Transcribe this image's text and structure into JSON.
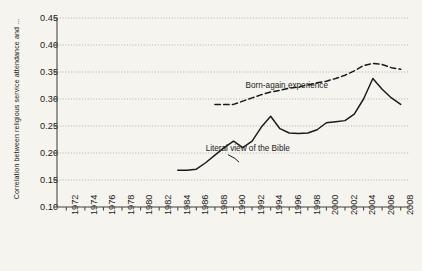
{
  "chart_data": {
    "type": "line",
    "title": "",
    "subtitle": "",
    "xlabel": "",
    "ylabel": "Correlation between religious service attendance and ...",
    "xlim": [
      1971,
      2009
    ],
    "ylim": [
      0.1,
      0.45
    ],
    "grid": true,
    "grid_style": "dotted-horizontal",
    "legend": "inline-annotations",
    "background_color": "#f6f4ee",
    "line_color": "#1a1a1a",
    "x_tick_labels": [
      "1972",
      "1974",
      "1976",
      "1978",
      "1980",
      "1982",
      "1984",
      "1986",
      "1988",
      "1990",
      "1992",
      "1994",
      "1996",
      "1998",
      "2000",
      "2002",
      "2004",
      "2006",
      "2008"
    ],
    "y_tick_labels": [
      "0.10",
      "0.15",
      "0.20",
      "0.25",
      "0.30",
      "0.35",
      "0.40",
      "0.45"
    ],
    "y_tick_values": [
      0.1,
      0.15,
      0.2,
      0.25,
      0.3,
      0.35,
      0.4,
      0.45
    ],
    "series": [
      {
        "name": "Literal view of the Bible",
        "style": "solid",
        "label_x": 1987.0,
        "label_y": 0.205,
        "x": [
          1984,
          1985,
          1986,
          1987,
          1988,
          1989,
          1990,
          1991,
          1992,
          1993,
          1994,
          1995,
          1996,
          1997,
          1998,
          1999,
          2000,
          2001,
          2002,
          2003,
          2004,
          2005,
          2006,
          2007,
          2008
        ],
        "values": [
          0.168,
          0.168,
          0.17,
          0.182,
          0.196,
          0.21,
          0.222,
          0.21,
          0.222,
          0.248,
          0.268,
          0.245,
          0.237,
          0.236,
          0.237,
          0.243,
          0.256,
          0.258,
          0.26,
          0.272,
          0.3,
          0.338,
          0.318,
          0.302,
          0.29
        ]
      },
      {
        "name": "Born-again experience",
        "style": "dashed",
        "label_x": 1991.3,
        "label_y": 0.322,
        "x": [
          1988,
          1989,
          1990,
          1991,
          1992,
          1993,
          1994,
          1995,
          1996,
          1997,
          1998,
          1999,
          2000,
          2001,
          2002,
          2003,
          2004,
          2005,
          2006,
          2007,
          2008
        ],
        "values": [
          0.29,
          0.29,
          0.29,
          0.296,
          0.302,
          0.308,
          0.313,
          0.316,
          0.32,
          0.322,
          0.326,
          0.33,
          0.333,
          0.338,
          0.344,
          0.352,
          0.362,
          0.366,
          0.364,
          0.358,
          0.355
        ]
      }
    ],
    "annotations": [
      {
        "text": "Born-again experience",
        "x": 1991.3,
        "y": 0.322
      },
      {
        "text": "Literal view of the Bible",
        "x": 1987.0,
        "y": 0.205
      }
    ]
  }
}
